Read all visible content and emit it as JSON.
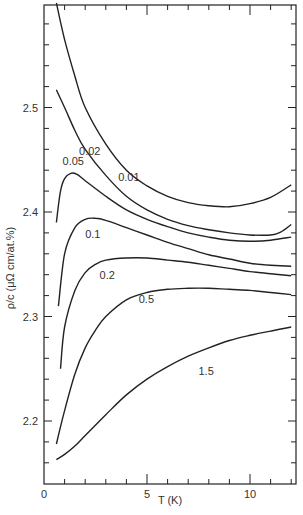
{
  "chart_data": {
    "type": "line",
    "title": "",
    "xlabel": "T (K)",
    "ylabel": "ρ/c (μΩ cm/at.%)",
    "xlim": [
      0,
      12.3
    ],
    "ylim": [
      2.14,
      2.6
    ],
    "x_ticks": [
      "0",
      "5",
      "10"
    ],
    "y_ticks": [
      "2.2",
      "2.3",
      "2.4",
      "2.5"
    ],
    "grid": false,
    "legend": "inline curve labels",
    "series": [
      {
        "name": "0.01",
        "label_pos": [
          3.6,
          2.43
        ],
        "x": [
          0.6,
          1,
          1.5,
          2,
          3,
          4,
          5,
          6,
          7,
          8,
          9,
          10,
          11,
          12
        ],
        "values": [
          2.6,
          2.565,
          2.53,
          2.5,
          2.465,
          2.44,
          2.425,
          2.415,
          2.409,
          2.406,
          2.405,
          2.408,
          2.414,
          2.426
        ]
      },
      {
        "name": "0.02",
        "label_pos": [
          1.7,
          2.455
        ],
        "x": [
          0.6,
          1,
          1.5,
          2,
          3,
          4,
          5,
          6,
          7,
          8,
          9,
          10,
          11,
          11.5,
          12
        ],
        "values": [
          2.517,
          2.5,
          2.478,
          2.46,
          2.435,
          2.415,
          2.402,
          2.393,
          2.387,
          2.383,
          2.38,
          2.378,
          2.378,
          2.381,
          2.388
        ]
      },
      {
        "name": "0.05",
        "label_pos": [
          0.9,
          2.445
        ],
        "x": [
          0.6,
          0.8,
          1,
          1.3,
          1.6,
          2,
          3,
          4,
          5,
          6,
          7,
          8,
          9,
          10,
          11,
          12
        ],
        "values": [
          2.39,
          2.42,
          2.432,
          2.437,
          2.436,
          2.43,
          2.415,
          2.402,
          2.393,
          2.386,
          2.38,
          2.376,
          2.373,
          2.372,
          2.373,
          2.376
        ]
      },
      {
        "name": "0.1",
        "label_pos": [
          2.0,
          2.375
        ],
        "x": [
          0.7,
          1,
          1.5,
          2,
          2.5,
          3,
          4,
          5,
          6,
          7,
          8,
          9,
          10,
          11,
          12
        ],
        "values": [
          2.31,
          2.36,
          2.385,
          2.393,
          2.394,
          2.392,
          2.385,
          2.378,
          2.371,
          2.365,
          2.359,
          2.355,
          2.351,
          2.349,
          2.348
        ]
      },
      {
        "name": "0.2",
        "label_pos": [
          2.7,
          2.336
        ],
        "x": [
          0.8,
          1,
          1.5,
          2,
          2.5,
          3,
          4,
          5,
          6,
          7,
          8,
          9,
          10,
          11,
          12
        ],
        "values": [
          2.25,
          2.29,
          2.325,
          2.342,
          2.35,
          2.354,
          2.356,
          2.356,
          2.354,
          2.352,
          2.349,
          2.346,
          2.343,
          2.341,
          2.339
        ]
      },
      {
        "name": "0.5",
        "label_pos": [
          4.6,
          2.313
        ],
        "x": [
          0.6,
          1,
          1.5,
          2,
          2.5,
          3,
          4,
          5,
          6,
          7,
          8,
          9,
          10,
          11,
          12
        ],
        "values": [
          2.178,
          2.21,
          2.245,
          2.27,
          2.287,
          2.3,
          2.316,
          2.323,
          2.326,
          2.327,
          2.327,
          2.326,
          2.325,
          2.323,
          2.321
        ]
      },
      {
        "name": "1.5",
        "label_pos": [
          7.5,
          2.244
        ],
        "x": [
          0.6,
          1,
          1.5,
          2,
          3,
          4,
          5,
          6,
          7,
          8,
          9,
          10,
          11,
          12
        ],
        "values": [
          2.163,
          2.168,
          2.176,
          2.186,
          2.206,
          2.225,
          2.24,
          2.252,
          2.262,
          2.27,
          2.277,
          2.282,
          2.286,
          2.29
        ]
      }
    ]
  }
}
